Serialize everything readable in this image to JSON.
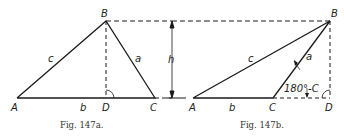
{
  "figures": [
    {
      "id": "fig-147a",
      "caption": "Fig. 147a.",
      "vertices": {
        "A": "A",
        "B": "B",
        "C": "C",
        "D": "D"
      },
      "sides": {
        "a": "a",
        "b": "b",
        "c": "c"
      }
    },
    {
      "id": "fig-147b",
      "caption": "Fig. 147b.",
      "vertices": {
        "A": "A",
        "B": "B",
        "C": "C",
        "D": "D"
      },
      "sides": {
        "a": "a",
        "b": "b",
        "c": "c"
      },
      "angle_label": "180°-C"
    }
  ],
  "height_label": "h",
  "colors": {
    "line": "#1a1a1a",
    "background": "#ffffff"
  }
}
